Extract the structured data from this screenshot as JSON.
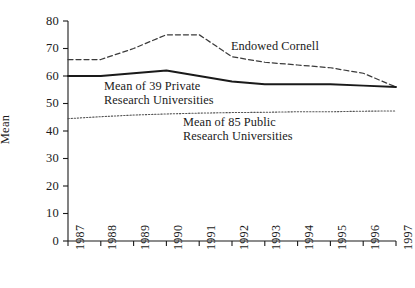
{
  "chart_data": {
    "type": "line",
    "title": "",
    "xlabel": "",
    "ylabel": "Mean",
    "xlim": [
      1987,
      1997
    ],
    "ylim": [
      0,
      80
    ],
    "yticks": [
      0,
      10,
      20,
      30,
      40,
      50,
      60,
      70,
      80
    ],
    "grid": false,
    "legend_position": "inline-annotations",
    "categories": [
      "1987",
      "1988",
      "1989",
      "1990",
      "1991",
      "1992",
      "1993",
      "1994",
      "1995",
      "1996",
      "1997"
    ],
    "x": [
      1987,
      1988,
      1989,
      1990,
      1991,
      1992,
      1993,
      1994,
      1995,
      1996,
      1997
    ],
    "series": [
      {
        "name": "Endowed Cornell",
        "style": "dashed",
        "color": "#3b3b3b",
        "values": [
          66,
          66,
          70,
          75,
          75,
          67,
          65,
          64,
          63,
          61,
          56
        ]
      },
      {
        "name": "Mean of 39 Private Research Universities",
        "style": "solid",
        "color": "#1a1a1a",
        "values": [
          60,
          60,
          61,
          62,
          60,
          58,
          57,
          57,
          57,
          56.5,
          56
        ]
      },
      {
        "name": "Mean of 85 Public Research Universities",
        "style": "dotted",
        "color": "#555555",
        "values": [
          44.5,
          45.2,
          45.8,
          46.2,
          46.5,
          46.7,
          46.8,
          47,
          47,
          47.2,
          47.3
        ]
      }
    ],
    "annotations": [
      {
        "id": "cornell",
        "text": "Endowed Cornell"
      },
      {
        "id": "private",
        "line1": "Mean of 39 Private",
        "line2": "Research Universities"
      },
      {
        "id": "public",
        "line1": "Mean of 85 Public",
        "line2": "Research Universities"
      }
    ]
  },
  "axis": {
    "y_label": "Mean",
    "y_ticks": [
      "80",
      "70",
      "60",
      "50",
      "40",
      "30",
      "20",
      "10",
      "0"
    ],
    "x_ticks": [
      "1987",
      "1988",
      "1989",
      "1990",
      "1991",
      "1992",
      "1993",
      "1994",
      "1995",
      "1996",
      "1997"
    ]
  },
  "annotations": {
    "cornell": "Endowed Cornell",
    "private_line1": "Mean of 39 Private",
    "private_line2": "Research Universities",
    "public_line1": "Mean of 85 Public",
    "public_line2": "Research Universities"
  },
  "colors": {
    "background": "#ffffff",
    "axis": "#1a1a1a",
    "cornell_line": "#3b3b3b",
    "private_line": "#1a1a1a",
    "public_line": "#555555"
  }
}
